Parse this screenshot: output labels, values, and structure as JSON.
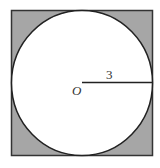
{
  "diagram": {
    "type": "circle-inscribed-in-square",
    "square": {
      "fill": "#a6a6a6",
      "stroke": "#333333"
    },
    "circle": {
      "fill": "#ffffff",
      "stroke": "#222222"
    },
    "center_label": "O",
    "radius_label": "3"
  }
}
